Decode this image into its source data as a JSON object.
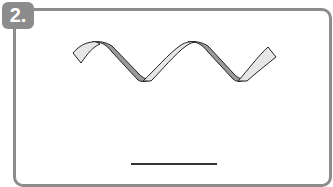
{
  "exercise": {
    "number_label": "2.",
    "figure": "ribbon-helix-spiral",
    "answer": ""
  },
  "colors": {
    "frame": "#8c8c8c",
    "badge_bg": "#8c8c8c",
    "badge_text": "#ffffff",
    "ribbon_front": "#e6e6e6",
    "ribbon_back": "#9a9a9a",
    "outline": "#222222",
    "answer_line": "#333333"
  }
}
